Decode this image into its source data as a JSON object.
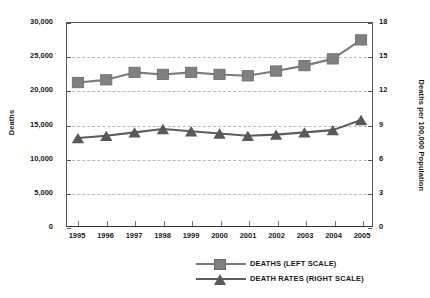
{
  "chart_data": {
    "type": "line",
    "title": "",
    "subtitle": "",
    "xlabel": "",
    "grid": true,
    "legend_position": "bottom-center",
    "categories": [
      "1995",
      "1996",
      "1997",
      "1998",
      "1999",
      "2000",
      "2001",
      "2002",
      "2003",
      "2004",
      "2005"
    ],
    "axes": {
      "left": {
        "label": "Deaths",
        "min": 0,
        "max": 30000,
        "step": 5000,
        "ticks": [
          "0",
          "5,000",
          "10,000",
          "15,000",
          "20,000",
          "25,000",
          "30,000"
        ],
        "tick_values": [
          0,
          5000,
          10000,
          15000,
          20000,
          25000,
          30000
        ]
      },
      "right": {
        "label": "Deaths per 100,000 Population",
        "min": 0,
        "max": 18,
        "step": 3,
        "ticks": [
          "0",
          "3",
          "6",
          "9",
          "12",
          "15",
          "18"
        ],
        "tick_values": [
          0,
          3,
          6,
          9,
          12,
          15,
          18
        ]
      }
    },
    "series": [
      {
        "name": "DEATHS (LEFT SCALE)",
        "axis": "left",
        "marker": "square",
        "color": "#808080",
        "line_color": "#7b7b7b",
        "values": [
          21200,
          21600,
          22700,
          22400,
          22700,
          22400,
          22200,
          22900,
          23700,
          24700,
          27500
        ]
      },
      {
        "name": "DEATH RATES (RIGHT SCALE)",
        "axis": "right",
        "marker": "triangle",
        "color": "#595959",
        "line_color": "#5d5d5d",
        "values": [
          7.8,
          8.0,
          8.3,
          8.6,
          8.4,
          8.2,
          8.0,
          8.1,
          8.3,
          8.5,
          9.4
        ]
      }
    ]
  },
  "legend": {
    "items": [
      {
        "label": "DEATHS (LEFT SCALE)",
        "marker": "square"
      },
      {
        "label": "DEATH RATES (RIGHT SCALE)",
        "marker": "triangle"
      }
    ]
  }
}
